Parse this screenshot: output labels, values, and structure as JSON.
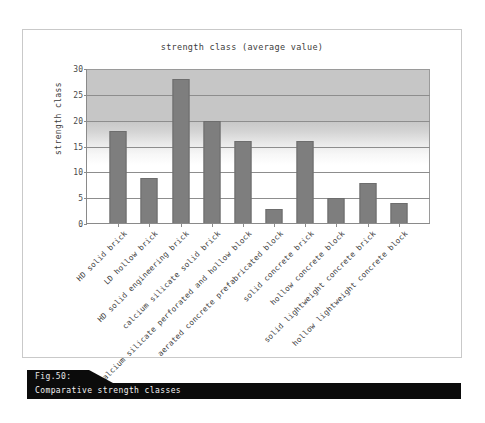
{
  "figure": {
    "caption_number": "Fig.50:",
    "caption_text": "Comparative strength classes"
  },
  "chart_data": {
    "type": "bar",
    "title": "strength class (average value)",
    "xlabel": "",
    "ylabel": "strength class",
    "ylim": [
      0,
      30
    ],
    "yticks": [
      0,
      5,
      10,
      15,
      20,
      25,
      30
    ],
    "grid": true,
    "legend": null,
    "bar_color": "#7e7e7e",
    "categories": [
      "HD solid brick",
      "LD hollow brick",
      "HD solid engineering brick",
      "calcium silicate solid brick",
      "calcium silicate perforated and hollow block",
      "aerated concrete prefabricated block",
      "solid concrete brick",
      "hollow concrete block",
      "solid lightweight concrete brick",
      "hollow lightweight concrete block"
    ],
    "values": [
      18,
      9,
      28,
      20,
      16,
      3,
      16,
      5,
      8,
      4
    ]
  }
}
